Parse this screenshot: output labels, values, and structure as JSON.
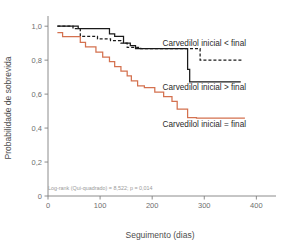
{
  "chart_data": {
    "type": "line",
    "subtype": "kaplan-meier-step",
    "title": "",
    "xlabel": "Seguimento (dias)",
    "ylabel": "Probabilidade de sobrevida",
    "xlim": [
      0,
      430
    ],
    "ylim": [
      0,
      1.06
    ],
    "xticks": [
      0,
      100,
      200,
      300,
      400
    ],
    "xtick_labels": [
      "0",
      "100",
      "200",
      "300",
      "400"
    ],
    "yticks": [
      0,
      0.2,
      0.4,
      0.6,
      0.8,
      1.0
    ],
    "ytick_labels": [
      "0",
      "0,2",
      "0,4",
      "0,6",
      "0,8",
      "1,0"
    ],
    "grid": false,
    "legend_position": "inline-annotations",
    "annotation": "Log-rank (Qui-quadrado) = 8,522; p = 0,014",
    "series": [
      {
        "name": "Carvedilol inicial < final",
        "color": "#1a1a1a",
        "dash": "3,2",
        "label_x": 300,
        "label_y": 0.885,
        "points": [
          [
            18,
            1.0
          ],
          [
            48,
            1.0
          ],
          [
            48,
            0.985
          ],
          [
            62,
            0.985
          ],
          [
            62,
            0.94
          ],
          [
            95,
            0.94
          ],
          [
            95,
            0.925
          ],
          [
            120,
            0.925
          ],
          [
            120,
            0.915
          ],
          [
            140,
            0.915
          ],
          [
            140,
            0.9
          ],
          [
            152,
            0.9
          ],
          [
            152,
            0.875
          ],
          [
            178,
            0.875
          ],
          [
            178,
            0.868
          ],
          [
            292,
            0.868
          ],
          [
            292,
            0.8
          ],
          [
            372,
            0.8
          ]
        ]
      },
      {
        "name": "Carvedilol inicial > final",
        "color": "#1a1a1a",
        "dash": "none",
        "label_x": 300,
        "label_y": 0.625,
        "points": [
          [
            18,
            1.0
          ],
          [
            58,
            1.0
          ],
          [
            58,
            0.985
          ],
          [
            118,
            0.985
          ],
          [
            118,
            0.955
          ],
          [
            128,
            0.955
          ],
          [
            128,
            0.94
          ],
          [
            145,
            0.94
          ],
          [
            145,
            0.9
          ],
          [
            158,
            0.9
          ],
          [
            158,
            0.885
          ],
          [
            168,
            0.885
          ],
          [
            168,
            0.868
          ],
          [
            268,
            0.868
          ],
          [
            268,
            0.745
          ],
          [
            272,
            0.745
          ],
          [
            272,
            0.672
          ],
          [
            370,
            0.672
          ]
        ]
      },
      {
        "name": "Carvedilol inicial = final",
        "color": "#d4714f",
        "dash": "none",
        "label_x": 300,
        "label_y": 0.405,
        "points": [
          [
            18,
            0.962
          ],
          [
            28,
            0.962
          ],
          [
            28,
            0.938
          ],
          [
            62,
            0.938
          ],
          [
            62,
            0.905
          ],
          [
            72,
            0.905
          ],
          [
            72,
            0.878
          ],
          [
            92,
            0.878
          ],
          [
            92,
            0.848
          ],
          [
            105,
            0.848
          ],
          [
            105,
            0.818
          ],
          [
            118,
            0.818
          ],
          [
            118,
            0.792
          ],
          [
            128,
            0.792
          ],
          [
            128,
            0.762
          ],
          [
            140,
            0.762
          ],
          [
            140,
            0.735
          ],
          [
            152,
            0.735
          ],
          [
            152,
            0.708
          ],
          [
            160,
            0.708
          ],
          [
            160,
            0.678
          ],
          [
            172,
            0.678
          ],
          [
            172,
            0.648
          ],
          [
            185,
            0.648
          ],
          [
            185,
            0.638
          ],
          [
            205,
            0.638
          ],
          [
            205,
            0.612
          ],
          [
            222,
            0.612
          ],
          [
            222,
            0.585
          ],
          [
            238,
            0.585
          ],
          [
            238,
            0.558
          ],
          [
            248,
            0.558
          ],
          [
            248,
            0.512
          ],
          [
            268,
            0.512
          ],
          [
            268,
            0.462
          ],
          [
            285,
            0.462
          ],
          [
            285,
            0.458
          ],
          [
            378,
            0.458
          ]
        ]
      }
    ]
  },
  "colors": {
    "series_black": "#1a1a1a",
    "series_orange": "#d4714f",
    "axis": "#808080",
    "tick_text": "#6e6e6e",
    "title_text": "#4d4d4d",
    "annotation_text": "#9a9a9a",
    "background": "#ffffff"
  }
}
